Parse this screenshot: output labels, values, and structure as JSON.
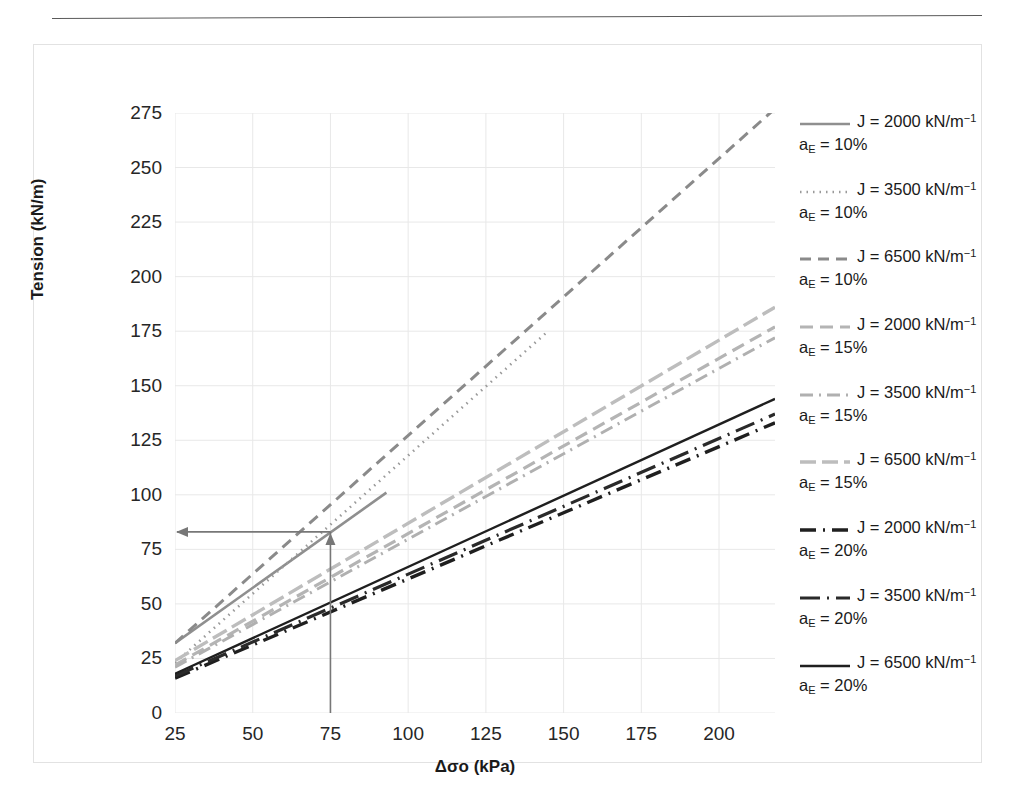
{
  "page_header": {
    "rule_visible": true,
    "faint_text": ""
  },
  "axes": {
    "y_title": "Tension (kN/m)",
    "x_title_parts": {
      "delta": "Δ",
      "sigma": "σ",
      "sub": "o",
      "units": "(kPa)"
    },
    "x_title": "Δσo (kPa)",
    "y_ticks": [
      "0",
      "25",
      "50",
      "75",
      "100",
      "125",
      "150",
      "175",
      "200",
      "225",
      "250",
      "275"
    ],
    "x_ticks": [
      "25",
      "50",
      "75",
      "100",
      "125",
      "150",
      "175",
      "200"
    ]
  },
  "legend": {
    "position": "right",
    "items": [
      {
        "j": "J = 2000 kN/m",
        "exp": "−1",
        "ae": "a",
        "ae_sub": "E",
        "ae_val": " = 10%",
        "style": "solid-thin-gray",
        "color": "#8f8f8f"
      },
      {
        "j": "J = 3500 kN/m",
        "exp": "−1",
        "ae": "a",
        "ae_sub": "E",
        "ae_val": " = 10%",
        "style": "dotted-gray",
        "color": "#9a9a9a"
      },
      {
        "j": "J = 6500 kN/m",
        "exp": "−1",
        "ae": "a",
        "ae_sub": "E",
        "ae_val": " = 10%",
        "style": "dashed-gray",
        "color": "#8a8a8a"
      },
      {
        "j": "J = 2000 kN/m",
        "exp": "−1",
        "ae": "a",
        "ae_sub": "E",
        "ae_val": " = 15%",
        "style": "dashed-light",
        "color": "#b4b4b4"
      },
      {
        "j": "J = 3500 kN/m",
        "exp": "−1",
        "ae": "a",
        "ae_sub": "E",
        "ae_val": " = 15%",
        "style": "dashdot-light",
        "color": "#b0b0b0"
      },
      {
        "j": "J = 6500 kN/m",
        "exp": "−1",
        "ae": "a",
        "ae_sub": "E",
        "ae_val": " = 15%",
        "style": "longdash-light",
        "color": "#bdbdbd"
      },
      {
        "j": "J = 2000 kN/m",
        "exp": "−1",
        "ae": "a",
        "ae_sub": "E",
        "ae_val": " = 20%",
        "style": "dashdot-black",
        "color": "#1f1f1f"
      },
      {
        "j": "J = 3500 kN/m",
        "exp": "−1",
        "ae": "a",
        "ae_sub": "E",
        "ae_val": " = 20%",
        "style": "dashdot2-black",
        "color": "#2a2a2a"
      },
      {
        "j": "J = 6500 kN/m",
        "exp": "−1",
        "ae": "a",
        "ae_sub": "E",
        "ae_val": " = 20%",
        "style": "solid-black",
        "color": "#1f1f1f"
      }
    ]
  },
  "annotation": {
    "vertical_from_x": 75,
    "vertical_from_y": 0,
    "meets_y": 83,
    "arrow_to_y_axis": true,
    "color": "#777777",
    "label": "construction-arrow"
  },
  "chart_data": {
    "type": "line",
    "title": "",
    "xlabel": "Δσo (kPa)",
    "ylabel": "Tension (kN/m)",
    "xlim": [
      25,
      218
    ],
    "ylim": [
      0,
      275
    ],
    "grid": true,
    "legend_position": "right",
    "x_ticks": [
      25,
      50,
      75,
      100,
      125,
      150,
      175,
      200
    ],
    "y_ticks": [
      0,
      25,
      50,
      75,
      100,
      125,
      150,
      175,
      200,
      225,
      250,
      275
    ],
    "series": [
      {
        "name": "J = 2000 kN/m-1, aE = 10%",
        "style": "solid-thin-gray",
        "color": "#8f8f8f",
        "x": [
          25,
          93
        ],
        "y": [
          32,
          101
        ]
      },
      {
        "name": "J = 3500 kN/m-1, aE = 10%",
        "style": "dotted-gray",
        "color": "#9a9a9a",
        "x": [
          25,
          145
        ],
        "y": [
          23,
          175
        ]
      },
      {
        "name": "J = 6500 kN/m-1, aE = 10%",
        "style": "dashed-gray",
        "color": "#8a8a8a",
        "x": [
          25,
          218
        ],
        "y": [
          32,
          277
        ]
      },
      {
        "name": "J = 2000 kN/m-1, aE = 15%",
        "style": "dashed-light",
        "color": "#b4b4b4",
        "x": [
          25,
          218
        ],
        "y": [
          22,
          177
        ]
      },
      {
        "name": "J = 3500 kN/m-1, aE = 15%",
        "style": "dashdot-light",
        "color": "#b0b0b0",
        "x": [
          25,
          218
        ],
        "y": [
          21,
          172
        ]
      },
      {
        "name": "J = 6500 kN/m-1, aE = 15%",
        "style": "longdash-light",
        "color": "#bdbdbd",
        "x": [
          25,
          218
        ],
        "y": [
          24,
          186
        ]
      },
      {
        "name": "J = 2000 kN/m-1, aE = 20%",
        "style": "dashdot-black",
        "color": "#1f1f1f",
        "x": [
          25,
          218
        ],
        "y": [
          16,
          133
        ]
      },
      {
        "name": "J = 3500 kN/m-1, aE = 20%",
        "style": "dashdot2-black",
        "color": "#2a2a2a",
        "x": [
          25,
          218
        ],
        "y": [
          17,
          137
        ]
      },
      {
        "name": "J = 6500 kN/m-1, aE = 20%",
        "style": "solid-black",
        "color": "#1f1f1f",
        "x": [
          25,
          218
        ],
        "y": [
          18,
          144
        ]
      }
    ],
    "annotations": [
      {
        "type": "arrow",
        "from": [
          75,
          0
        ],
        "to": [
          75,
          83
        ],
        "note": "vertical guide at 75 kPa"
      },
      {
        "type": "arrow",
        "from": [
          75,
          83
        ],
        "to": [
          25,
          83
        ],
        "note": "horizontal guide to Tension axis at ~83 kN/m"
      }
    ]
  }
}
